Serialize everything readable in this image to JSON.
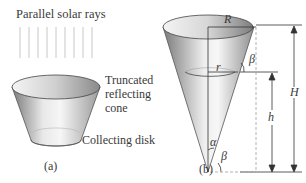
{
  "figure_a": {
    "rays_label": "Parallel solar rays",
    "cone_label_line1": "Truncated",
    "cone_label_line2": "reflecting",
    "cone_label_line3": "cone",
    "disk_label": "Collecting disk",
    "caption": "(a)",
    "ray_count": 9
  },
  "figure_b": {
    "R": "R",
    "r": "r",
    "H": "H",
    "h": "h",
    "alpha": "α",
    "beta_top": "β",
    "beta_bottom": "β",
    "caption": "(b)"
  },
  "colors": {
    "text": "#3a3a3a",
    "cone_dark": "#8a8a8a",
    "cone_light": "#f0f0f0",
    "rays": "#c8c8c8",
    "dashed": "#a0a0a0"
  }
}
